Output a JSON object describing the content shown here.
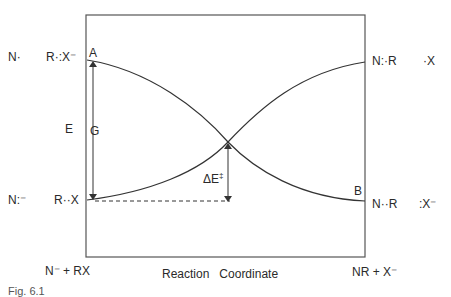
{
  "diagram": {
    "type": "reaction-energy-diagram",
    "left_states": {
      "upper": {
        "species_1": "N·",
        "species_2": "R·:X⁻",
        "point_label": "A"
      },
      "lower": {
        "species_1": "N:⁻",
        "species_2": "R··X"
      }
    },
    "right_states": {
      "upper": {
        "species_1": "N:·R",
        "species_2": "·X"
      },
      "lower": {
        "species_1": "N··R",
        "species_2": ":X⁻",
        "point_label": "B"
      }
    },
    "axis_label_y": "E",
    "gap_label": "G",
    "barrier_label": "ΔE",
    "barrier_superscript": "‡",
    "bottom": {
      "reactants": "N⁻ + RX",
      "x_axis_label": "Reaction   Coordinate",
      "products": "NR + X⁻"
    },
    "caption_partial": "Fig. 6.1"
  }
}
